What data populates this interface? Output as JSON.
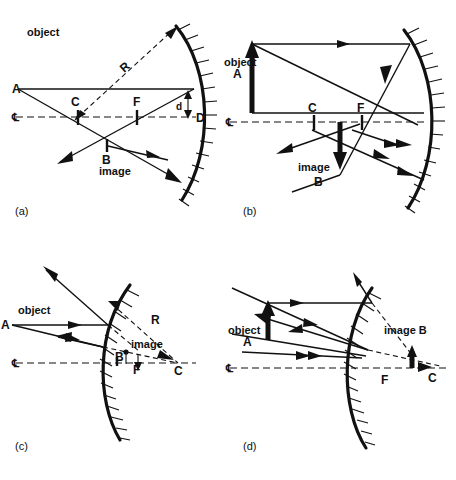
{
  "figure": {
    "background_color": "#ffffff",
    "ink_color": "#111111",
    "panels": [
      {
        "key": "a",
        "panel_label": "(a)",
        "mirror_type": "concave",
        "labels": {
          "object": "object",
          "object_point": "A",
          "image": "image",
          "image_point": "B",
          "center_of_curvature": "C",
          "focal_point": "F",
          "radius": "R",
          "vertex": "D",
          "offset": "d",
          "centerline_left": "℄",
          "centerline_right": "℄"
        }
      },
      {
        "key": "b",
        "panel_label": "(b)",
        "mirror_type": "concave",
        "labels": {
          "object": "object",
          "object_point": "A",
          "image": "image",
          "image_point": "B",
          "center_of_curvature": "C",
          "focal_point": "F",
          "centerline_left": "℄"
        }
      },
      {
        "key": "c",
        "panel_label": "(c)",
        "mirror_type": "convex",
        "labels": {
          "object": "object",
          "object_point": "A",
          "image": "image",
          "image_point": "B",
          "center_of_curvature": "C",
          "focal_point": "F",
          "radius": "R",
          "centerline_left": "℄",
          "centerline_right": "℄"
        }
      },
      {
        "key": "d",
        "panel_label": "(d)",
        "mirror_type": "convex",
        "labels": {
          "object": "object",
          "object_point": "A",
          "image": "image  B",
          "center_of_curvature": "C",
          "focal_point": "F",
          "centerline_left": "℄"
        }
      }
    ]
  }
}
